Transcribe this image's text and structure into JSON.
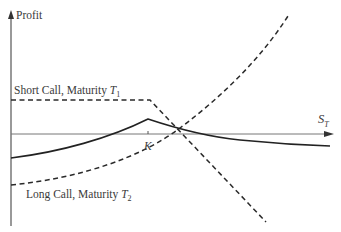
{
  "diagram": {
    "y_axis_label": "Profit",
    "x_axis_label": "S",
    "x_axis_label_sub": "T",
    "strike_label": "K",
    "curves": [
      {
        "name": "Short Call, Maturity T1",
        "label": "Short Call, Maturity ",
        "label_var": "T",
        "label_sub": "1",
        "style": "dashed"
      },
      {
        "name": "Long Call, Maturity T2",
        "label": "Long Call, Maturity ",
        "label_var": "T",
        "label_sub": "2",
        "style": "dashed"
      },
      {
        "name": "Calendar spread profit",
        "style": "solid"
      }
    ],
    "colors": {
      "line": "#2a2a2a",
      "axis": "#555555"
    }
  }
}
